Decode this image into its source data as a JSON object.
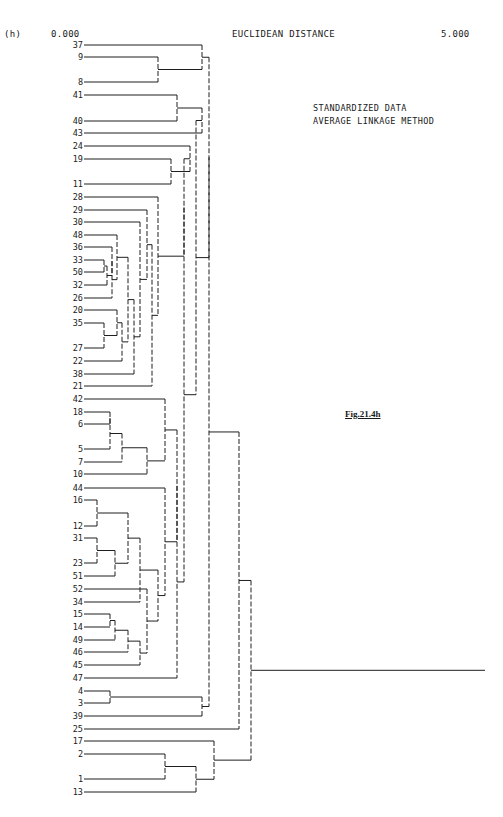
{
  "page_number": "",
  "chart_data": {
    "type": "dendrogram",
    "panel_label": "(h)",
    "title": "EUCLIDEAN DISTANCE",
    "x_axis": {
      "min_label": "0.000",
      "max_label": "5.000",
      "range": [
        0,
        5
      ]
    },
    "notes": [
      "STANDARDIZED DATA",
      "AVERAGE LINKAGE METHOD"
    ],
    "figure_caption": "Fig.21.4h",
    "leaves": [
      {
        "label": "37",
        "y": 45
      },
      {
        "label": "9",
        "y": 57
      },
      {
        "label": "8",
        "y": 82
      },
      {
        "label": "41",
        "y": 95
      },
      {
        "label": "40",
        "y": 121
      },
      {
        "label": "43",
        "y": 133
      },
      {
        "label": "24",
        "y": 146
      },
      {
        "label": "19",
        "y": 159
      },
      {
        "label": "11",
        "y": 184
      },
      {
        "label": "28",
        "y": 197
      },
      {
        "label": "29",
        "y": 210
      },
      {
        "label": "30",
        "y": 222
      },
      {
        "label": "48",
        "y": 235
      },
      {
        "label": "36",
        "y": 247
      },
      {
        "label": "33",
        "y": 260
      },
      {
        "label": "50",
        "y": 272
      },
      {
        "label": "32",
        "y": 285
      },
      {
        "label": "26",
        "y": 298
      },
      {
        "label": "20",
        "y": 310
      },
      {
        "label": "35",
        "y": 323
      },
      {
        "label": "27",
        "y": 348
      },
      {
        "label": "22",
        "y": 361
      },
      {
        "label": "38",
        "y": 374
      },
      {
        "label": "21",
        "y": 386
      },
      {
        "label": "42",
        "y": 399
      },
      {
        "label": "18",
        "y": 412
      },
      {
        "label": "6",
        "y": 424
      },
      {
        "label": "5",
        "y": 449
      },
      {
        "label": "7",
        "y": 462
      },
      {
        "label": "10",
        "y": 474
      },
      {
        "label": "44",
        "y": 488
      },
      {
        "label": "16",
        "y": 500
      },
      {
        "label": "12",
        "y": 526
      },
      {
        "label": "31",
        "y": 538
      },
      {
        "label": "23",
        "y": 563
      },
      {
        "label": "51",
        "y": 576
      },
      {
        "label": "52",
        "y": 589
      },
      {
        "label": "34",
        "y": 602
      },
      {
        "label": "15",
        "y": 614
      },
      {
        "label": "14",
        "y": 627
      },
      {
        "label": "49",
        "y": 640
      },
      {
        "label": "46",
        "y": 652
      },
      {
        "label": "45",
        "y": 665
      },
      {
        "label": "47",
        "y": 678
      },
      {
        "label": "4",
        "y": 691
      },
      {
        "label": "3",
        "y": 703
      },
      {
        "label": "39",
        "y": 716
      },
      {
        "label": "25",
        "y": 729
      },
      {
        "label": "17",
        "y": 741
      },
      {
        "label": "2",
        "y": 754
      },
      {
        "label": "1",
        "y": 779
      },
      {
        "label": "13",
        "y": 792
      }
    ],
    "merges": [
      {
        "id": "m9_8",
        "a": "9",
        "b": "8",
        "x": 158
      },
      {
        "id": "m37",
        "a": "37",
        "b": "m9_8",
        "x": 202
      },
      {
        "id": "m41_40",
        "a": "41",
        "b": "40",
        "x": 177
      },
      {
        "id": "m43",
        "a": "m41_40",
        "b": "43",
        "x": 202
      },
      {
        "id": "m19_11",
        "a": "19",
        "b": "11",
        "x": 171
      },
      {
        "id": "m24",
        "a": "24",
        "b": "m19_11",
        "x": 190
      },
      {
        "id": "m33_50",
        "a": "33",
        "b": "50",
        "x": 104
      },
      {
        "id": "m32",
        "a": "m33_50",
        "b": "32",
        "x": 107
      },
      {
        "id": "m36",
        "a": "36",
        "b": "m32",
        "x": 112
      },
      {
        "id": "m26",
        "a": "m36",
        "b": "26",
        "x": 112
      },
      {
        "id": "m48",
        "a": "48",
        "b": "m26",
        "x": 117
      },
      {
        "id": "m35_27",
        "a": "35",
        "b": "27",
        "x": 104
      },
      {
        "id": "m20",
        "a": "20",
        "b": "m35_27",
        "x": 117
      },
      {
        "id": "m22",
        "a": "m20",
        "b": "22",
        "x": 122
      },
      {
        "id": "mA",
        "a": "m48",
        "b": "m22",
        "x": 128
      },
      {
        "id": "m38",
        "a": "mA",
        "b": "38",
        "x": 134
      },
      {
        "id": "mB",
        "a": "30",
        "b": "m38",
        "x": 140
      },
      {
        "id": "m29",
        "a": "29",
        "b": "mB",
        "x": 147
      },
      {
        "id": "m21",
        "a": "m29",
        "b": "21",
        "x": 152
      },
      {
        "id": "m28",
        "a": "28",
        "b": "m21",
        "x": 158
      },
      {
        "id": "m24g",
        "a": "m24",
        "b": "m28",
        "x": 184
      },
      {
        "id": "m18_6",
        "a": "18",
        "b": "6",
        "x": 110
      },
      {
        "id": "m5",
        "a": "m18_6",
        "b": "5",
        "x": 110
      },
      {
        "id": "m7",
        "a": "m5",
        "b": "7",
        "x": 122
      },
      {
        "id": "m10",
        "a": "m7",
        "b": "10",
        "x": 147
      },
      {
        "id": "m16_12",
        "a": "16",
        "b": "12",
        "x": 97
      },
      {
        "id": "m31_23",
        "a": "31",
        "b": "23",
        "x": 97
      },
      {
        "id": "m51",
        "a": "m31_23",
        "b": "51",
        "x": 115
      },
      {
        "id": "mC",
        "a": "m16_12",
        "b": "m51",
        "x": 128
      },
      {
        "id": "m34",
        "a": "mC",
        "b": "34",
        "x": 140
      },
      {
        "id": "m15_14",
        "a": "15",
        "b": "14",
        "x": 110
      },
      {
        "id": "m49",
        "a": "m15_14",
        "b": "49",
        "x": 115
      },
      {
        "id": "m46",
        "a": "m49",
        "b": "46",
        "x": 128
      },
      {
        "id": "m45",
        "a": "m46",
        "b": "45",
        "x": 140
      },
      {
        "id": "m52",
        "a": "52",
        "b": "m45",
        "x": 147
      },
      {
        "id": "mD",
        "a": "m34",
        "b": "m52",
        "x": 158
      },
      {
        "id": "m44",
        "a": "44",
        "b": "mD",
        "x": 165
      },
      {
        "id": "m42",
        "a": "42",
        "b": "m10",
        "x": 165
      },
      {
        "id": "mE",
        "a": "m42",
        "b": "m44",
        "x": 177
      },
      {
        "id": "m47",
        "a": "mE",
        "b": "47",
        "x": 177
      },
      {
        "id": "mF",
        "a": "m24g",
        "b": "m47",
        "x": 184
      },
      {
        "id": "mG",
        "a": "m43",
        "b": "mF",
        "x": 196
      },
      {
        "id": "mH",
        "a": "m37",
        "b": "mG",
        "x": 209
      },
      {
        "id": "m4_3",
        "a": "4",
        "b": "3",
        "x": 110
      },
      {
        "id": "m39",
        "a": "m4_3",
        "b": "39",
        "x": 202
      },
      {
        "id": "mI",
        "a": "mH",
        "b": "m39",
        "x": 209
      },
      {
        "id": "m25",
        "a": "mI",
        "b": "25",
        "x": 239
      },
      {
        "id": "m2_1",
        "a": "2",
        "b": "1",
        "x": 165
      },
      {
        "id": "m13",
        "a": "m2_1",
        "b": "13",
        "x": 196
      },
      {
        "id": "m17",
        "a": "17",
        "b": "m13",
        "x": 214
      },
      {
        "id": "root",
        "a": "m25",
        "b": "m17",
        "x": 251
      }
    ],
    "root_stem_end_x": 485,
    "leaf_line_start_x": 84,
    "grid": false
  }
}
